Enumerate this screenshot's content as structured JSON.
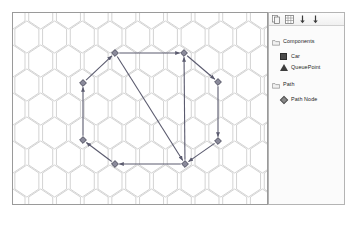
{
  "canvas": {
    "name": "hex-grid-canvas",
    "background": "#ffffff",
    "border_color": "#9a9a9a",
    "hex_stroke": "#c8c8c8",
    "hex_radius": 16,
    "edge_color": "#5a5a6e",
    "node_fill": "#8a8a9a",
    "node_stroke": "#4a4a5a",
    "nodes": [
      {
        "id": "n1",
        "label": "Path Node",
        "x": 115,
        "y": 53
      },
      {
        "id": "n2",
        "label": "Path Node",
        "x": 184,
        "y": 53
      },
      {
        "id": "n3",
        "label": "Path Node",
        "x": 218,
        "y": 82
      },
      {
        "id": "n4",
        "label": "Path Node",
        "x": 218,
        "y": 141
      },
      {
        "id": "n5",
        "label": "Path Node",
        "x": 185,
        "y": 164
      },
      {
        "id": "n6",
        "label": "Path Node",
        "x": 115,
        "y": 164
      },
      {
        "id": "n7",
        "label": "Path Node",
        "x": 83,
        "y": 140
      },
      {
        "id": "n8",
        "label": "Path Node",
        "x": 83,
        "y": 83
      }
    ],
    "edges": [
      {
        "from": "n1",
        "to": "n2"
      },
      {
        "from": "n2",
        "to": "n3"
      },
      {
        "from": "n3",
        "to": "n4"
      },
      {
        "from": "n4",
        "to": "n5"
      },
      {
        "from": "n5",
        "to": "n6"
      },
      {
        "from": "n6",
        "to": "n7"
      },
      {
        "from": "n7",
        "to": "n8"
      },
      {
        "from": "n8",
        "to": "n1"
      },
      {
        "from": "n1",
        "to": "n5"
      },
      {
        "from": "n5",
        "to": "n2"
      }
    ]
  },
  "legend": {
    "name": "legend-panel",
    "toolbar": {
      "buttons": [
        {
          "name": "copy-icon",
          "title": "Copy"
        },
        {
          "name": "table-icon",
          "title": "Table"
        },
        {
          "name": "move-down-icon",
          "title": "Move Down"
        },
        {
          "name": "move-down-alt-icon",
          "title": "Move Down"
        }
      ]
    },
    "groups": [
      {
        "label": "Components",
        "icon": "folder-icon",
        "items": [
          {
            "label": "Car",
            "swatch": "square",
            "color": "#4a4a4a"
          },
          {
            "label": "QueuePoint",
            "swatch": "triangle",
            "color": "#3d3d3d"
          }
        ]
      },
      {
        "label": "Path",
        "icon": "folder-icon",
        "items": [
          {
            "label": "Path Node",
            "swatch": "diamond",
            "color": "#888888"
          }
        ]
      }
    ]
  }
}
